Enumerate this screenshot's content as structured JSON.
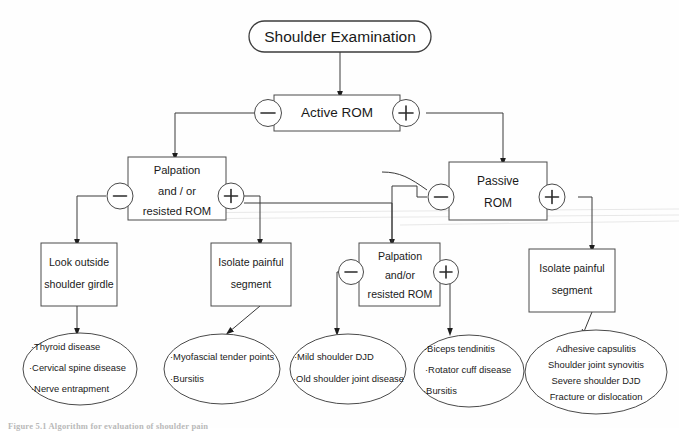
{
  "document": {
    "title": "Shoulder Examination",
    "caption": "Figure 5.1 Algorithm for evaluation of shoulder pain"
  },
  "nodes": {
    "root": {
      "label": "Shoulder Examination",
      "shape": "rounded-rectangle"
    },
    "active_rom": {
      "label": "Active ROM",
      "shape": "rectangle"
    },
    "palpation_left": {
      "lines": [
        "Palpation",
        "and / or",
        "resisted ROM"
      ],
      "shape": "rectangle"
    },
    "passive_rom": {
      "lines": [
        "Passive",
        "ROM"
      ],
      "shape": "rectangle"
    },
    "look_outside": {
      "lines": [
        "Look outside",
        "shoulder girdle"
      ],
      "shape": "rectangle"
    },
    "isolate_left": {
      "lines": [
        "Isolate painful",
        "segment"
      ],
      "shape": "rectangle"
    },
    "palpation_right": {
      "lines": [
        "Palpation",
        "and/or",
        "resisted ROM"
      ],
      "shape": "rectangle"
    },
    "isolate_right": {
      "lines": [
        "Isolate painful",
        "segment"
      ],
      "shape": "rectangle"
    }
  },
  "operators": {
    "minus": "−",
    "plus": "+",
    "active_minus": "−",
    "active_plus": "+",
    "palpation_left_minus": "−",
    "palpation_left_plus": "+",
    "passive_minus": "−",
    "passive_plus": "+",
    "palpation_right_minus": "−",
    "palpation_right_plus": "+"
  },
  "outcomes": {
    "thyroid_group": {
      "items": [
        "·Thyroid disease",
        "·Cervical spine disease",
        "·Nerve entrapment"
      ]
    },
    "myofascial_group": {
      "items": [
        "·Myofascial  tender points",
        "·Bursitis"
      ]
    },
    "mild_djd_group": {
      "items": [
        "·Mild shoulder DJD",
        "·Old shoulder joint disease"
      ]
    },
    "biceps_group": {
      "items": [
        "·Biceps  tendinitis",
        "·Rotator cuff disease",
        "·Bursitis"
      ]
    },
    "adhesive_group": {
      "items": [
        "Adhesive  capsulitis",
        "Shoulder joint  synovitis",
        "Severe shoulder DJD",
        "Fracture or dislocation"
      ]
    }
  },
  "colors": {
    "stroke": "#4a4a4a",
    "text": "#1a1a1a",
    "background": "#fefefe"
  }
}
